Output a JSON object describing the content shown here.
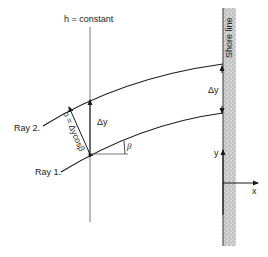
{
  "diagram": {
    "labels": {
      "depth_contour": "h = constant",
      "shore_line": "Shore line",
      "ray_1": "Ray 1.",
      "ray_2": "Ray 2.",
      "delta_y_left": "Δy",
      "delta_y_shore": "Δy",
      "b_formula": "b = Δycosβ",
      "beta": "β",
      "axis_y": "y",
      "axis_x": "x"
    },
    "colors": {
      "line": "#1a1a1a",
      "thin_line": "#555555",
      "shore_fill": "#bdbdbd"
    }
  }
}
